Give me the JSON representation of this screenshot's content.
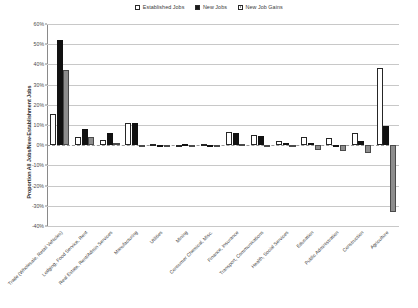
{
  "chart_data": {
    "type": "bar",
    "title": "",
    "xlabel": "",
    "ylabel": "Proportion All Jobs/New-Establishment Jobs",
    "ylim": [
      -40,
      60
    ],
    "ytick_labels": [
      "60%",
      "50%",
      "40%",
      "30%",
      "20%",
      "10%",
      "0%",
      "-10%",
      "-20%",
      "-30%",
      "-40%"
    ],
    "ytick_values": [
      60,
      50,
      40,
      30,
      20,
      10,
      0,
      -10,
      -20,
      -30,
      -40
    ],
    "grid": true,
    "legend_position": "top-center",
    "categories": [
      "Trade (Wholesale, Retail Vehicles)",
      "Lodging, Food Service, Rent",
      "Real Estate, Rent/Admin Services",
      "Manufacturing",
      "Utilities",
      "Mining",
      "Consumer Chemical, Misc.",
      "Finance, Insurance",
      "Transport, Communications",
      "Health, Social Services",
      "Education",
      "Public Administration",
      "Construction",
      "Agriculture"
    ],
    "series": [
      {
        "name": "Established Jobs",
        "color": "#ffffff",
        "values": [
          15.5,
          4.0,
          2.5,
          11.0,
          0.4,
          0.3,
          0.7,
          6.5,
          5.0,
          2.0,
          4.0,
          3.5,
          6.0,
          38.0
        ]
      },
      {
        "name": "New Jobs",
        "color": "#111111",
        "values": [
          52.0,
          8.0,
          6.0,
          11.0,
          0.3,
          0.5,
          0.3,
          6.0,
          4.5,
          1.0,
          1.2,
          0.2,
          2.0,
          9.5
        ]
      },
      {
        "name": "New Job Gains",
        "color": "#8d8d8d",
        "values": [
          37.0,
          4.0,
          1.0,
          0.2,
          0.2,
          0.2,
          -0.5,
          0.4,
          0.3,
          -0.5,
          -2.5,
          -3.0,
          -4.0,
          -33.0
        ]
      }
    ]
  },
  "legend": {
    "items": [
      {
        "label": "Established Jobs",
        "icon": "square-outline-swatch"
      },
      {
        "label": "New Jobs",
        "icon": "square-filled-black-swatch"
      },
      {
        "label": "New Job Gains",
        "icon": "square-filled-gray-swatch"
      }
    ]
  }
}
